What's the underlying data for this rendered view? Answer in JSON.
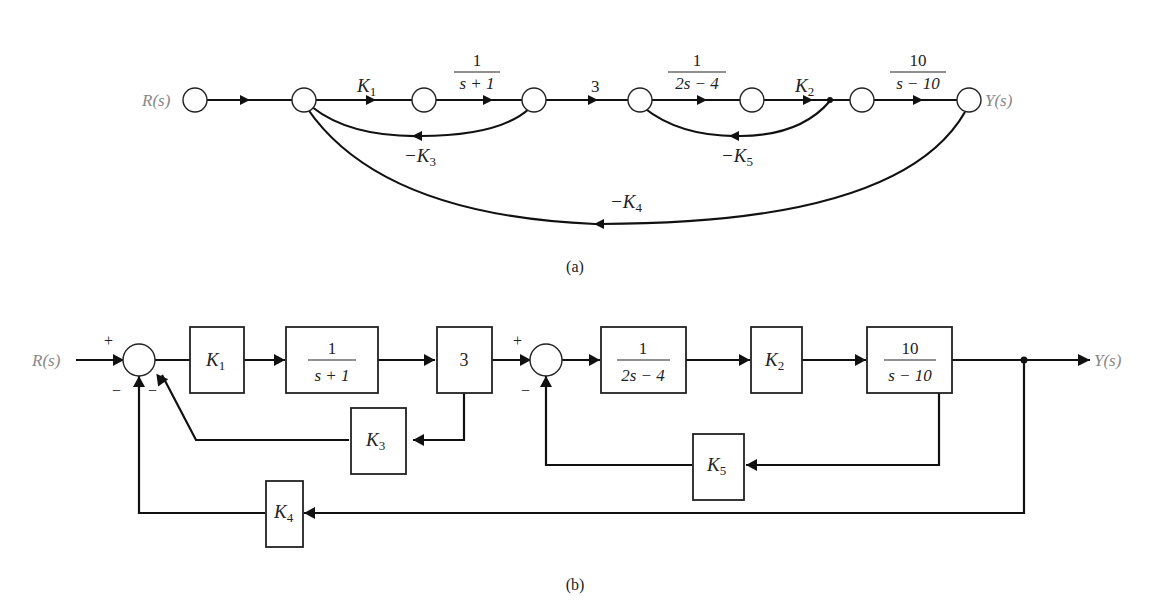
{
  "figure_a": {
    "caption": "(a)",
    "input_label": "R(s)",
    "output_label": "Y(s)",
    "branches": {
      "k1": {
        "symbol": "K",
        "sub": "1"
      },
      "g1": {
        "num": "1",
        "den": "s + 1"
      },
      "three": "3",
      "g2": {
        "num": "1",
        "den": "2s − 4"
      },
      "k2": {
        "symbol": "K",
        "sub": "2"
      },
      "g3": {
        "num": "10",
        "den": "s − 10"
      },
      "fb_k3": {
        "prefix": "−K",
        "sub": "3"
      },
      "fb_k5": {
        "prefix": "−K",
        "sub": "5"
      },
      "fb_k4": {
        "prefix": "−K",
        "sub": "4"
      }
    }
  },
  "figure_b": {
    "caption": "(b)",
    "input_label": "R(s)",
    "output_label": "Y(s)",
    "signs": {
      "sum1_plus": "+",
      "sum1_minus_a": "−",
      "sum1_minus_b": "−",
      "sum2_plus": "+",
      "sum2_minus": "−"
    },
    "blocks": {
      "k1": {
        "symbol": "K",
        "sub": "1"
      },
      "g1": {
        "num": "1",
        "den": "s + 1"
      },
      "three": "3",
      "g2": {
        "num": "1",
        "den": "2s − 4"
      },
      "k2": {
        "symbol": "K",
        "sub": "2"
      },
      "g3": {
        "num": "10",
        "den": "s − 10"
      },
      "k3": {
        "symbol": "K",
        "sub": "3"
      },
      "k5": {
        "symbol": "K",
        "sub": "5"
      },
      "k4": {
        "symbol": "K",
        "sub": "4"
      }
    }
  }
}
